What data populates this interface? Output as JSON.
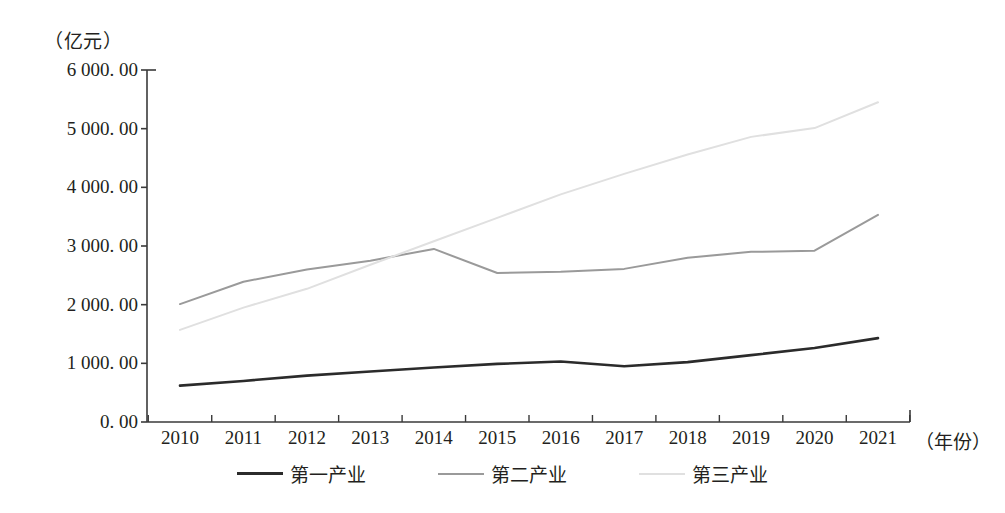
{
  "chart_data": {
    "type": "line",
    "title": "",
    "subtitle": "",
    "unit_label": "（亿元）",
    "ylabel": "",
    "xlabel": "（年份）",
    "grid": false,
    "legend_position": "bottom",
    "x": [
      2010,
      2011,
      2012,
      2013,
      2014,
      2015,
      2016,
      2017,
      2018,
      2019,
      2020,
      2021
    ],
    "categories": [
      "2010",
      "2011",
      "2012",
      "2013",
      "2014",
      "2015",
      "2016",
      "2017",
      "2018",
      "2019",
      "2020",
      "2021"
    ],
    "ylim": [
      0,
      6000
    ],
    "yticks": [
      0,
      1000,
      2000,
      3000,
      4000,
      5000,
      6000
    ],
    "ytick_labels": [
      "0. 00",
      "1 000. 00",
      "2 000. 00",
      "3 000. 00",
      "4 000. 00",
      "5 000. 00",
      "6 000. 00"
    ],
    "series": [
      {
        "name": "第一产业",
        "color": "#2b2b2b",
        "width": 2.6,
        "values": [
          620,
          700,
          790,
          860,
          930,
          990,
          1030,
          950,
          1020,
          1140,
          1260,
          1430
        ]
      },
      {
        "name": "第二产业",
        "color": "#9a9a9a",
        "width": 2.0,
        "values": [
          2010,
          2390,
          2600,
          2750,
          2950,
          2540,
          2560,
          2610,
          2800,
          2900,
          2920,
          3530
        ]
      },
      {
        "name": "第三产业",
        "color": "#e0e0e0",
        "width": 2.0,
        "values": [
          1570,
          1950,
          2270,
          2680,
          3080,
          3480,
          3880,
          4230,
          4560,
          4860,
          5010,
          5450
        ]
      }
    ]
  },
  "axis": {
    "x_title": "（年份）"
  }
}
